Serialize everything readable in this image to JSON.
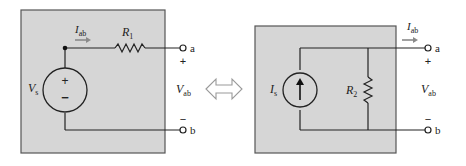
{
  "diagram": {
    "type": "source-transformation equivalence",
    "colors": {
      "box_fill": "#d6d6d6",
      "box_border": "#555555",
      "wire": "#222222",
      "arrow_gray": "#8a8a8a",
      "equivalence_arrow": "#9a9a9a"
    },
    "left_circuit": {
      "source": {
        "symbol": "V",
        "subscript": "s",
        "kind": "voltage-source",
        "plus": "+",
        "minus": "−"
      },
      "resistor": {
        "symbol": "R",
        "subscript": "1"
      },
      "current": {
        "symbol": "I",
        "subscript": "ab"
      },
      "terminal_a": "a",
      "terminal_b": "b",
      "voltage": {
        "symbol": "V",
        "subscript": "ab",
        "plus": "+",
        "minus": "−"
      }
    },
    "equivalence_symbol": "double-headed-arrow",
    "right_circuit": {
      "source": {
        "symbol": "I",
        "subscript": "s",
        "kind": "current-source"
      },
      "resistor": {
        "symbol": "R",
        "subscript": "2"
      },
      "current": {
        "symbol": "I",
        "subscript": "ab"
      },
      "terminal_a": "a",
      "terminal_b": "b",
      "voltage": {
        "symbol": "V",
        "subscript": "ab",
        "plus": "+",
        "minus": "−"
      }
    }
  }
}
